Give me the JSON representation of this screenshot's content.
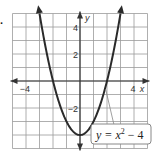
{
  "problem_number": ".",
  "chart_data": {
    "type": "line",
    "title": "",
    "function_label": "y = x^2 - 4",
    "function_label_parts": {
      "lhs": "y = x",
      "exp": "2",
      "rhs": " − 4"
    },
    "xlabel": "x",
    "ylabel": "y",
    "xlim": [
      -5,
      5
    ],
    "ylim": [
      -5,
      5
    ],
    "grid": true,
    "x_tick_labels": [
      {
        "value": -4,
        "text": "−4"
      },
      {
        "value": 4,
        "text": "4"
      }
    ],
    "y_tick_labels": [
      {
        "value": 4,
        "text": "4"
      },
      {
        "value": 2,
        "text": "2"
      },
      {
        "value": -2,
        "text": "−2"
      }
    ],
    "series": [
      {
        "name": "y = x^2 - 4",
        "x": [
          -3,
          -2.5,
          -2,
          -1.5,
          -1,
          -0.5,
          0,
          0.5,
          1,
          1.5,
          2,
          2.5,
          3
        ],
        "y": [
          5,
          2.25,
          0,
          -1.75,
          -3,
          -3.75,
          -4,
          -3.75,
          -3,
          -1.75,
          0,
          2.25,
          5
        ]
      }
    ],
    "colors": {
      "curve": "#2a2a2a",
      "grid": "#9a9a9a",
      "axis": "#333333",
      "label_border": "#888888"
    }
  }
}
